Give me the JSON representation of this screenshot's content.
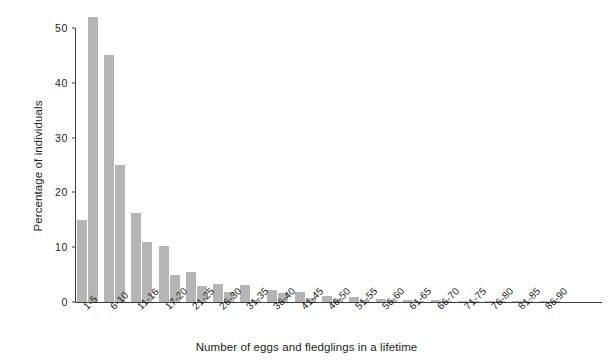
{
  "chart_data": {
    "type": "bar",
    "title": "",
    "xlabel": "Number of eggs and fledglings in a lifetime",
    "ylabel": "Percentage of individuals",
    "categories": [
      "1-5",
      "6-10",
      "11-16",
      "17-20",
      "21-25",
      "26-30",
      "31-35",
      "36-40",
      "41-45",
      "46-50",
      "51-55",
      "56-60",
      "61-65",
      "66-70",
      "71-75",
      "76-80",
      "81-85",
      "86-90"
    ],
    "series": [
      {
        "name": "eggs",
        "values": [
          15.0,
          45.0,
          16.3,
          10.2,
          5.5,
          3.2,
          3.1,
          2.2,
          1.8,
          1.1,
          1.0,
          0.5,
          0.3,
          0.3,
          0.2,
          0.2,
          0.2,
          0.2
        ]
      },
      {
        "name": "fledglings",
        "values": [
          52.0,
          25.0,
          11.0,
          4.9,
          3.0,
          1.9,
          0.4,
          1.7,
          0.8,
          0.6,
          0.3,
          0.3,
          0.2,
          0.2,
          0.1,
          0.1,
          0.1,
          0.1
        ]
      }
    ],
    "yticks": [
      0,
      10,
      20,
      30,
      40,
      50
    ],
    "ylim": [
      0,
      53
    ],
    "grid": false,
    "legend": "none",
    "bar_color": "#b5b5b5",
    "axis_color": "#3c3c3c"
  }
}
